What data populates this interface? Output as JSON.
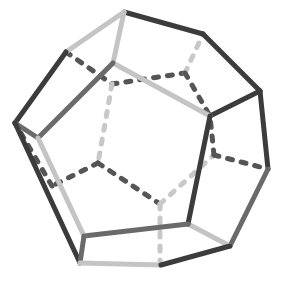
{
  "figure": {
    "title": "Dodecahedron wireframe",
    "colors": {
      "background": "#ffffff",
      "dark": "#3c3c3c",
      "mid": "#6a6a6a",
      "light": "#c4c4c4",
      "hidden_dark": "#555555",
      "hidden_light": "#c8c8c8"
    },
    "vertices": {
      "A": [
        124,
        12
      ],
      "B": [
        203,
        34
      ],
      "C": [
        260,
        91
      ],
      "D": [
        210,
        116
      ],
      "E": [
        113,
        63
      ],
      "F": [
        66,
        52
      ],
      "G": [
        15,
        123
      ],
      "H": [
        38,
        138
      ],
      "I": [
        268,
        169
      ],
      "J": [
        188,
        224
      ],
      "K": [
        84,
        236
      ],
      "L": [
        80,
        263
      ],
      "M": [
        161,
        265
      ],
      "N": [
        230,
        246
      ],
      "P": [
        185,
        73
      ],
      "Q": [
        98,
        163
      ],
      "R": [
        160,
        204
      ],
      "S": [
        214,
        155
      ],
      "T": [
        112,
        84
      ],
      "U": [
        160,
        262
      ],
      "V": [
        52,
        186
      ]
    },
    "edges": [
      {
        "from": "A",
        "to": "B",
        "style": "solid",
        "tone": "dark"
      },
      {
        "from": "B",
        "to": "C",
        "style": "solid",
        "tone": "dark"
      },
      {
        "from": "C",
        "to": "D",
        "style": "solid",
        "tone": "dark"
      },
      {
        "from": "D",
        "to": "E",
        "style": "solid",
        "tone": "light"
      },
      {
        "from": "E",
        "to": "A",
        "style": "solid",
        "tone": "light"
      },
      {
        "from": "A",
        "to": "F",
        "style": "solid",
        "tone": "light"
      },
      {
        "from": "F",
        "to": "G",
        "style": "solid",
        "tone": "dark"
      },
      {
        "from": "G",
        "to": "H",
        "style": "solid",
        "tone": "mid"
      },
      {
        "from": "H",
        "to": "E",
        "style": "solid",
        "tone": "mid"
      },
      {
        "from": "C",
        "to": "I",
        "style": "solid",
        "tone": "dark"
      },
      {
        "from": "I",
        "to": "N",
        "style": "solid",
        "tone": "mid"
      },
      {
        "from": "N",
        "to": "J",
        "style": "solid",
        "tone": "light"
      },
      {
        "from": "J",
        "to": "D",
        "style": "solid",
        "tone": "dark"
      },
      {
        "from": "J",
        "to": "K",
        "style": "solid",
        "tone": "mid"
      },
      {
        "from": "K",
        "to": "H",
        "style": "solid",
        "tone": "light"
      },
      {
        "from": "G",
        "to": "L",
        "style": "solid",
        "tone": "dark"
      },
      {
        "from": "L",
        "to": "K",
        "style": "solid",
        "tone": "mid"
      },
      {
        "from": "L",
        "to": "M",
        "style": "solid",
        "tone": "light"
      },
      {
        "from": "M",
        "to": "N",
        "style": "solid",
        "tone": "dark"
      },
      {
        "from": "F",
        "to": "T",
        "style": "dashed",
        "tone": "hidden_dark"
      },
      {
        "from": "T",
        "to": "P",
        "style": "dashed",
        "tone": "hidden_dark"
      },
      {
        "from": "P",
        "to": "B",
        "style": "dashed",
        "tone": "hidden_light"
      },
      {
        "from": "P",
        "to": "D",
        "style": "dashed",
        "tone": "hidden_dark"
      },
      {
        "from": "T",
        "to": "Q",
        "style": "dashed",
        "tone": "hidden_light"
      },
      {
        "from": "Q",
        "to": "V",
        "style": "dashed",
        "tone": "hidden_dark"
      },
      {
        "from": "V",
        "to": "G",
        "style": "dashed",
        "tone": "hidden_dark"
      },
      {
        "from": "Q",
        "to": "R",
        "style": "dashed",
        "tone": "hidden_dark"
      },
      {
        "from": "R",
        "to": "S",
        "style": "dashed",
        "tone": "hidden_light"
      },
      {
        "from": "S",
        "to": "D",
        "style": "dashed",
        "tone": "hidden_dark"
      },
      {
        "from": "S",
        "to": "I",
        "style": "dashed",
        "tone": "hidden_dark"
      },
      {
        "from": "R",
        "to": "U",
        "style": "dashed",
        "tone": "hidden_light"
      }
    ]
  }
}
